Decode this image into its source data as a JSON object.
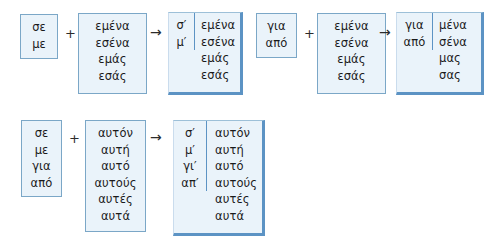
{
  "diagram": {
    "colors": {
      "box_fill": "#eaf3fa",
      "box_border": "#7ba7c7",
      "result_shadow": "#5c93c4",
      "text": "#1a1a1a",
      "background": "#ffffff"
    },
    "operators": {
      "plus": "+",
      "arrow": "→"
    },
    "rows": [
      {
        "id": "row-1",
        "groups": [
          {
            "id": "group-1a",
            "operand_1": {
              "words": [
                "σε",
                "με"
              ]
            },
            "operator_1": "+",
            "operand_2": {
              "words": [
                "εμένα",
                "εσένα",
                "εμάς",
                "εσάς"
              ]
            },
            "operator_2": "→",
            "result": {
              "prefixes": [
                "σ′",
                "μ′"
              ],
              "values": [
                "εμένα",
                "εσένα",
                "εμάς",
                "εσάς"
              ]
            }
          },
          {
            "id": "group-1b",
            "operand_1": {
              "words": [
                "για",
                "από"
              ]
            },
            "operator_1": "+",
            "operand_2": {
              "words": [
                "εμένα",
                "εσένα",
                "εμάς",
                "εσάς"
              ]
            },
            "operator_2": "→",
            "result": {
              "prefixes": [
                "για",
                "από"
              ],
              "values": [
                "μένα",
                "σένα",
                "μας",
                "σας"
              ]
            }
          }
        ]
      },
      {
        "id": "row-2",
        "groups": [
          {
            "id": "group-2a",
            "operand_1": {
              "words": [
                "σε",
                "με",
                "για",
                "από"
              ]
            },
            "operator_1": "+",
            "operand_2": {
              "words": [
                "αυτόν",
                "αυτή",
                "αυτό",
                "αυτούς",
                "αυτές",
                "αυτά"
              ]
            },
            "operator_2": "→",
            "result": {
              "prefixes": [
                "σ′",
                "μ′",
                "γι′",
                "απ′"
              ],
              "values": [
                "αυτόν",
                "αυτή",
                "αυτό",
                "αυτούς",
                "αυτές",
                "αυτά"
              ]
            }
          }
        ]
      }
    ]
  }
}
